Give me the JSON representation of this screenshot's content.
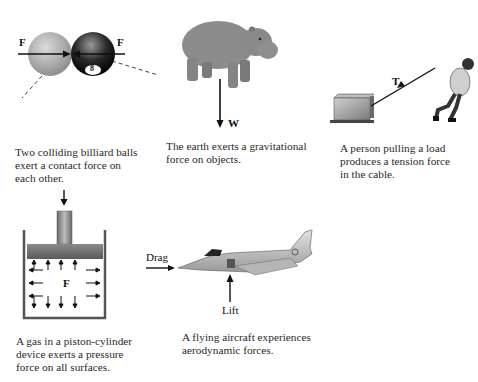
{
  "panels": {
    "billiard": {
      "force_left_label": "F",
      "force_right_label": "F",
      "ball_number": "8",
      "caption": "Two colliding billiard balls\nexert a contact force on\neach other."
    },
    "hippo": {
      "force_label": "W",
      "caption": "The earth exerts a gravitational\nforce on objects."
    },
    "tension": {
      "force_label": "T",
      "caption": "A person pulling a load\nproduces a tension force\nin the cable."
    },
    "piston": {
      "force_label": "F",
      "caption": "A gas in a piston-cylinder\ndevice exerts a pressure\nforce on all surfaces."
    },
    "aircraft": {
      "drag_label": "Drag",
      "lift_label": "Lift",
      "caption": "A flying aircraft experiences\naerodynamic forces."
    }
  },
  "colors": {
    "background": "#ffffff",
    "arrow": "#111111",
    "ball_light": "#b8b8b8",
    "ball_dark": "#1a1a1a",
    "hippo": "#8a8a8a",
    "piston": "#7a7a7a"
  }
}
